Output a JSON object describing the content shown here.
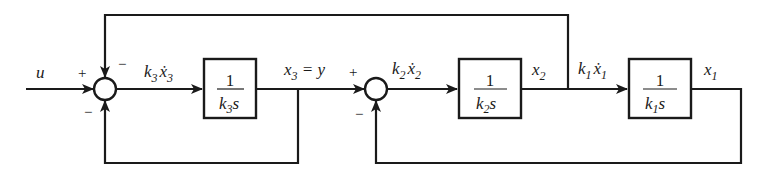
{
  "diagram": {
    "type": "block-diagram",
    "input": {
      "label": "u"
    },
    "summing_junctions": [
      {
        "id": "sum1",
        "signs": {
          "left": "+",
          "top": "−",
          "bottom": "−"
        }
      },
      {
        "id": "sum2",
        "signs": {
          "left": "+",
          "bottom": "−"
        }
      }
    ],
    "blocks": [
      {
        "id": "block3",
        "numerator": "1",
        "denominator_k": "k",
        "denominator_sub": "3",
        "denominator_s": "s"
      },
      {
        "id": "block2",
        "numerator": "1",
        "denominator_k": "k",
        "denominator_sub": "2",
        "denominator_s": "s"
      },
      {
        "id": "block1",
        "numerator": "1",
        "denominator_k": "k",
        "denominator_sub": "1",
        "denominator_s": "s"
      }
    ],
    "signals": {
      "k3x3dot": {
        "k": "k",
        "k_sub": "3",
        "x": "ẋ",
        "x_sub": "3"
      },
      "x3_eq_y": {
        "x": "x",
        "x_sub": "3",
        "eq": " = y"
      },
      "k2x2dot": {
        "k": "k",
        "k_sub": "2",
        "x": "ẋ",
        "x_sub": "2"
      },
      "x2": {
        "x": "x",
        "x_sub": "2"
      },
      "k1x1dot": {
        "k": "k",
        "k_sub": "1",
        "x": "ẋ",
        "x_sub": "1"
      },
      "x1": {
        "x": "x",
        "x_sub": "1"
      }
    },
    "signs": {
      "plus": "+",
      "minus": "−"
    }
  }
}
